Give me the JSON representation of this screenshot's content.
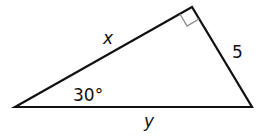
{
  "diagram": {
    "type": "right-triangle",
    "stroke_color": "#111111",
    "marker_color": "#888888",
    "vertices": {
      "left": {
        "x": 15,
        "y": 107
      },
      "top": {
        "x": 192,
        "y": 7
      },
      "right": {
        "x": 252,
        "y": 107
      }
    },
    "right_angle_at": "top",
    "labels": {
      "hypotenuse_side_top": "x",
      "short_leg": "5",
      "base": "y",
      "angle": "30°"
    }
  }
}
